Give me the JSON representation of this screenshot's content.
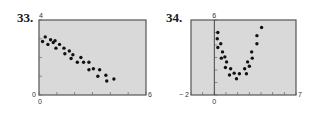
{
  "chart_data": [
    {
      "type": "scatter",
      "label": "33.",
      "title": "",
      "xlabel": "",
      "ylabel": "",
      "xlim": [
        0,
        6
      ],
      "ylim": [
        0,
        4
      ],
      "x_tick_labels": {
        "min": "0",
        "max": "6"
      },
      "y_tick_labels": {
        "min": "0",
        "max": "4"
      },
      "grid": false,
      "background": "#d9d9d9",
      "frame": {
        "left": 39,
        "top": 20,
        "right": 146,
        "bottom": 95
      },
      "points": [
        [
          0.2,
          2.85
        ],
        [
          0.35,
          3.1
        ],
        [
          0.5,
          2.7
        ],
        [
          0.65,
          2.95
        ],
        [
          0.8,
          2.8
        ],
        [
          0.9,
          2.9
        ],
        [
          0.95,
          2.5
        ],
        [
          1.15,
          2.7
        ],
        [
          1.4,
          2.5
        ],
        [
          1.45,
          2.2
        ],
        [
          1.7,
          2.35
        ],
        [
          1.8,
          1.95
        ],
        [
          1.9,
          2.15
        ],
        [
          2.15,
          1.75
        ],
        [
          2.35,
          2.0
        ],
        [
          2.5,
          1.75
        ],
        [
          2.8,
          1.75
        ],
        [
          2.8,
          1.35
        ],
        [
          3.05,
          1.4
        ],
        [
          3.3,
          1.0
        ],
        [
          3.4,
          1.35
        ],
        [
          3.75,
          1.05
        ],
        [
          3.8,
          0.75
        ],
        [
          4.2,
          0.85
        ]
      ]
    },
    {
      "type": "scatter",
      "label": "34.",
      "title": "",
      "xlabel": "",
      "ylabel": "",
      "xlim": [
        -2,
        7
      ],
      "ylim": [
        0,
        6
      ],
      "x_tick_labels": {
        "min": "− 2",
        "zero": "0",
        "max": "7"
      },
      "y_tick_labels": {
        "max": "6"
      },
      "grid": false,
      "background": "#d9d9d9",
      "frame": {
        "left": 191,
        "top": 20,
        "right": 296,
        "bottom": 95
      },
      "points": [
        [
          0.3,
          5.0
        ],
        [
          0.25,
          4.5
        ],
        [
          0.55,
          4.1
        ],
        [
          0.3,
          3.8
        ],
        [
          0.7,
          3.45
        ],
        [
          0.6,
          2.95
        ],
        [
          0.9,
          3.05
        ],
        [
          1.05,
          2.65
        ],
        [
          0.95,
          2.2
        ],
        [
          1.4,
          2.1
        ],
        [
          1.3,
          1.6
        ],
        [
          1.7,
          1.75
        ],
        [
          1.9,
          1.3
        ],
        [
          2.15,
          1.7
        ],
        [
          2.6,
          2.1
        ],
        [
          2.75,
          1.7
        ],
        [
          2.85,
          2.65
        ],
        [
          3.0,
          2.3
        ],
        [
          3.2,
          3.45
        ],
        [
          3.25,
          2.95
        ],
        [
          3.65,
          4.1
        ],
        [
          3.65,
          4.75
        ],
        [
          4.05,
          5.4
        ]
      ]
    }
  ],
  "labels": {
    "plot33_number": "33.",
    "plot34_number": "34."
  },
  "colors": {
    "plot_background": "#d9d9d9",
    "frame": "#555555",
    "point": "#111111"
  }
}
